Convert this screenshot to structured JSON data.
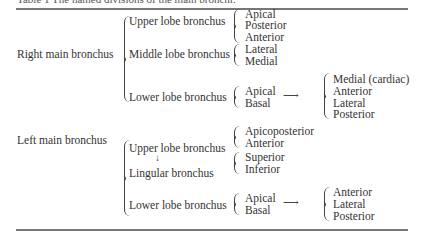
{
  "table": {
    "caption": "Table 1  The named divisions of the main bronchi.",
    "right": {
      "label": "Right main bronchus",
      "upper": {
        "label": "Upper lobe bronchus",
        "segments": [
          "Apical",
          "Posterior",
          "Anterior"
        ]
      },
      "middle": {
        "label": "Middle lobe bronchus",
        "segments": [
          "Lateral",
          "Medial"
        ]
      },
      "lower": {
        "label": "Lower lobe bronchus",
        "segments": [
          "Apical",
          "Basal"
        ],
        "basal_arrow": "⟶",
        "basal": [
          "Medial (cardiac)",
          "Anterior",
          "Lateral",
          "Posterior"
        ]
      }
    },
    "left": {
      "label": "Left main bronchus",
      "upper": {
        "label": "Upper lobe bronchus",
        "segments": [
          "Apicoposterior",
          "Anterior"
        ]
      },
      "down_arrow": "↓",
      "lingular": {
        "label": "Lingular bronchus",
        "segments": [
          "Superior",
          "Inferior"
        ]
      },
      "lower": {
        "label": "Lower lobe bronchus",
        "segments": [
          "Apical",
          "Basal"
        ],
        "basal_arrow": "⟶",
        "basal": [
          "Anterior",
          "Lateral",
          "Posterior"
        ]
      }
    }
  }
}
